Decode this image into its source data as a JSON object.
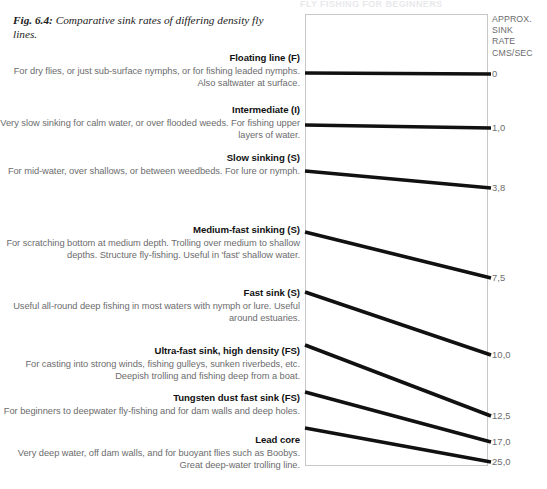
{
  "running_header": "FLY FISHING FOR BEGINNERS",
  "caption": {
    "fig_number": "Fig. 6.4:",
    "text": " Comparative sink rates of differing density fly lines."
  },
  "rate_column": {
    "heading": "APPROX.\nSINK\nRATE\nCMS/SEC",
    "heading_lines": [
      "APPROX.",
      "SINK",
      "RATE",
      "CMS/SEC"
    ]
  },
  "entries": [
    {
      "title": "Floating line (F)",
      "body": "For dry flies, or just sub-surface nymphs, or for fishing leaded nymphs. Also saltwater at surface.",
      "rate": "0",
      "top": 52,
      "line_left_y": 59,
      "line_right_y": 60
    },
    {
      "title": "Intermediate (I)",
      "body": "Very slow sinking for calm water, or over flooded weeds. For fishing upper layers of water.",
      "rate": "1,0",
      "top": 104,
      "line_left_y": 111,
      "line_right_y": 114
    },
    {
      "title": "Slow sinking (S)",
      "body": "For mid-water, over shallows, or between weedbeds. For lure or nymph.",
      "rate": "3,8",
      "top": 152,
      "line_left_y": 157,
      "line_right_y": 174
    },
    {
      "title": "Medium-fast sinking (S)",
      "body": "For scratching bottom at medium depth. Trolling over medium to shallow depths. Structure fly-fishing. Useful in 'fast' shallow water.",
      "rate": "7,5",
      "top": 224,
      "line_left_y": 218,
      "line_right_y": 264
    },
    {
      "title": "Fast sink (S)",
      "body": "Useful all-round deep fishing in most waters with nymph or lure. Useful around estuaries.",
      "rate": "10,0",
      "top": 287,
      "line_left_y": 278,
      "line_right_y": 341
    },
    {
      "title": "Ultra-fast sink, high density (FS)",
      "body": "For casting into strong winds, fishing gulleys, sunken riverbeds, etc. Deepish trolling and fishing deep from a boat.",
      "rate": "12,5",
      "top": 345,
      "line_left_y": 331,
      "line_right_y": 402
    },
    {
      "title": "Tungsten dust fast sink (FS)",
      "body": "For beginners to deepwater fly-fishing and for dam walls and deep holes.",
      "rate": "17,0",
      "top": 392,
      "line_left_y": 378,
      "line_right_y": 428
    },
    {
      "title": "Lead core",
      "body": "Very deep water, off dam walls, and for buoyant flies such as Boobys. Great deep-water trolling line.",
      "rate": "25,0",
      "top": 434,
      "line_left_y": 414,
      "line_right_y": 448
    }
  ],
  "chart_data": {
    "type": "line",
    "title": "Comparative sink rates of differing density fly lines",
    "xlabel": "",
    "ylabel": "APPROX. SINK RATE CMS/SEC",
    "grid": false,
    "legend": "right-labels",
    "categories": [
      "Floating line (F)",
      "Intermediate (I)",
      "Slow sinking (S)",
      "Medium-fast sinking (S)",
      "Fast sink (S)",
      "Ultra-fast sink, high density (FS)",
      "Tungsten dust fast sink (FS)",
      "Lead core"
    ],
    "values": [
      0,
      1.0,
      3.8,
      7.5,
      10.0,
      12.5,
      17.0,
      25.0
    ],
    "value_labels": [
      "0",
      "1,0",
      "3,8",
      "7,5",
      "10,0",
      "12,5",
      "17,0",
      "25,0"
    ],
    "units": "cms/sec"
  },
  "colors": {
    "line": "#111111",
    "box_border": "#c8c8c8",
    "body_text": "#6c6c6e",
    "title_text": "#111111"
  }
}
